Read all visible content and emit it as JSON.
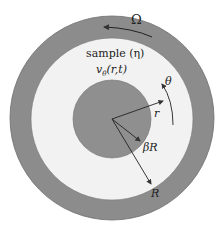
{
  "diagram": {
    "type": "concentric-cylinder-rheometer-schematic",
    "labels": {
      "rotation": "Ω",
      "sample": "sample (η)",
      "velocity": "v",
      "velocity_sub": "θ",
      "velocity_args": "(r,t)",
      "theta": "θ",
      "r": "r",
      "inner_radius": "βR",
      "outer_radius": "R"
    },
    "colors": {
      "outer_ring": "#8c8c8c",
      "sample": "#f2f2f2",
      "inner_cylinder": "#8f8f8f",
      "line": "#333333",
      "background": "#ffffff"
    },
    "geometry": {
      "center": [
        112,
        119
      ],
      "outer_ring_radius": 102,
      "sample_outer_radius": 82,
      "inner_radius": 40
    }
  }
}
